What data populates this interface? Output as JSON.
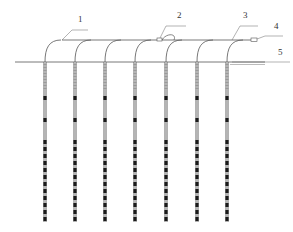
{
  "diagram": {
    "type": "engineering-schematic",
    "colors": {
      "line": "#555555",
      "pipe_dark": "#1a1a1a",
      "pipe_light": "#e8e8e8",
      "background": "#ffffff"
    },
    "ground_line_y": 62,
    "header_y": 40,
    "pipe_bottom_y": 222,
    "pipes": [
      {
        "id": 1,
        "x": 45
      },
      {
        "id": 2,
        "x": 75
      },
      {
        "id": 3,
        "x": 105
      },
      {
        "id": 4,
        "x": 135
      },
      {
        "id": 5,
        "x": 166
      },
      {
        "id": 6,
        "x": 197
      },
      {
        "id": 7,
        "x": 227
      }
    ],
    "callouts": [
      {
        "text": "1",
        "x": 78,
        "y": 22
      },
      {
        "text": "2",
        "x": 177,
        "y": 18
      },
      {
        "text": "3",
        "x": 243,
        "y": 18
      },
      {
        "text": "4",
        "x": 274,
        "y": 29
      },
      {
        "text": "5",
        "x": 278,
        "y": 55
      }
    ]
  }
}
